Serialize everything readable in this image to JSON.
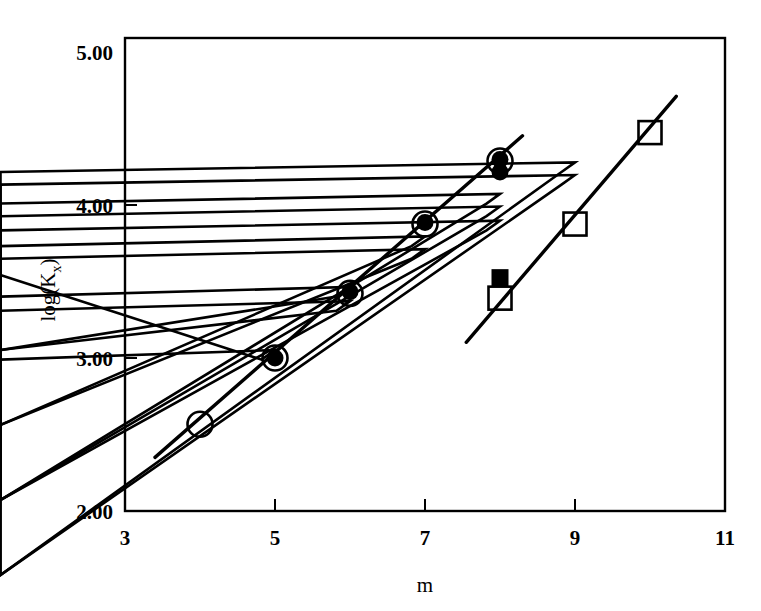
{
  "figure": {
    "background_color": "#ffffff",
    "ink_color": "#000000"
  },
  "chart_data": {
    "type": "scatter",
    "title": "",
    "subtitle": "",
    "xlabel": "m",
    "ylabel": "log(Kx)",
    "ylabel_base": "log(K",
    "ylabel_sub": "x",
    "ylabel_close": ")",
    "xlim": [
      3,
      11
    ],
    "ylim": [
      2.0,
      5.0
    ],
    "xticks": [
      3,
      5,
      7,
      9,
      11
    ],
    "xtick_labels": [
      "3",
      "5",
      "7",
      "9",
      "11"
    ],
    "yticks": [
      2.0,
      3.0,
      4.0,
      5.0
    ],
    "ytick_labels": [
      "2.00",
      "3.00",
      "4.00",
      "5.00"
    ],
    "grid": false,
    "legend": "none",
    "frame": "full-box",
    "series": [
      {
        "name": "open-circle",
        "marker": "open circle",
        "points": [
          {
            "x": 4,
            "y": 2.55
          },
          {
            "x": 5,
            "y": 2.97
          },
          {
            "x": 6,
            "y": 3.38
          },
          {
            "x": 7,
            "y": 3.82
          },
          {
            "x": 8,
            "y": 4.22
          }
        ]
      },
      {
        "name": "filled-circle",
        "marker": "filled circle",
        "points": [
          {
            "x": 5,
            "y": 2.97
          },
          {
            "x": 6,
            "y": 3.39
          },
          {
            "x": 7,
            "y": 3.83
          },
          {
            "x": 8,
            "y": 4.23
          },
          {
            "x": 8,
            "y": 4.15
          }
        ]
      },
      {
        "name": "open-triangle",
        "marker": "open triangle",
        "points": [
          {
            "x": 5,
            "y": 2.96
          },
          {
            "x": 6,
            "y": 3.36
          },
          {
            "x": 6,
            "y": 3.27
          },
          {
            "x": 7,
            "y": 3.68
          },
          {
            "x": 7,
            "y": 3.6
          },
          {
            "x": 8,
            "y": 3.95
          },
          {
            "x": 8,
            "y": 3.87
          },
          {
            "x": 8,
            "y": 3.78
          },
          {
            "x": 9,
            "y": 4.15
          },
          {
            "x": 9,
            "y": 4.07
          }
        ]
      },
      {
        "name": "open-square",
        "marker": "open square",
        "points": [
          {
            "x": 8,
            "y": 3.35
          },
          {
            "x": 9,
            "y": 3.82
          },
          {
            "x": 10,
            "y": 4.4
          }
        ]
      },
      {
        "name": "filled-square",
        "marker": "filled square",
        "points": [
          {
            "x": 8,
            "y": 3.48
          }
        ]
      }
    ],
    "trend_lines": [
      {
        "name": "upper-regression-line",
        "x_start": 3.4,
        "y_start": 2.34,
        "x_end": 8.3,
        "y_end": 4.38
      },
      {
        "name": "lower-regression-line",
        "x_start": 7.55,
        "y_start": 3.07,
        "x_end": 10.35,
        "y_end": 4.63
      }
    ]
  }
}
